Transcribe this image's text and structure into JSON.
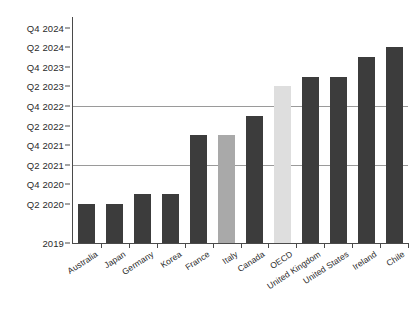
{
  "chart_data": {
    "type": "bar",
    "title": "",
    "subtitle": "",
    "xlabel": "",
    "ylabel": "",
    "grid": "horizontal-gridlines-at-Q2-2021-and-Q4-2022",
    "legend_position": "none",
    "categories": [
      "Australia",
      "Japan",
      "Germany",
      "Korea",
      "France",
      "Italy",
      "Canada",
      "OECD",
      "United Kingdom",
      "United States",
      "Ireland",
      "Chile"
    ],
    "values": [
      "Q2 2021",
      "Q2 2021",
      "Q3 2021",
      "Q3 2021",
      "Q3 2022",
      "Q3 2022",
      "Q1 2023",
      "Q3 2023",
      "Q4 2023",
      "Q4 2023",
      "Q2 2024",
      "Q3 2024"
    ],
    "value_index": [
      4,
      4,
      5,
      5,
      11,
      11,
      13,
      16,
      17,
      17,
      19,
      20
    ],
    "y_tick_labels": [
      "Q4 2024",
      "Q2 2024",
      "Q4 2023",
      "Q2 2023",
      "Q4 2022",
      "Q2 2022",
      "Q4 2021",
      "Q2 2021",
      "Q4 2020",
      "Q2 2020",
      "2019"
    ],
    "y_tick_index": [
      22,
      20,
      18,
      16,
      14,
      12,
      10,
      8,
      6,
      4,
      0
    ],
    "ylim_index": [
      0,
      23
    ],
    "gridline_labels": [
      "Q4 2022",
      "Q2 2021"
    ],
    "gridline_index": [
      14,
      8
    ],
    "series_colors": {
      "default": "#3c3c3c",
      "Italy": "#a9a9a9",
      "OECD": "#dedede"
    },
    "bar_colors": [
      "#3c3c3c",
      "#3c3c3c",
      "#3c3c3c",
      "#3c3c3c",
      "#3c3c3c",
      "#a9a9a9",
      "#3c3c3c",
      "#dedede",
      "#3c3c3c",
      "#3c3c3c",
      "#3c3c3c",
      "#3c3c3c"
    ],
    "axis_color": "#4a4a4a",
    "gridline_color": "#9a9a9a",
    "background_color": "#ffffff"
  }
}
